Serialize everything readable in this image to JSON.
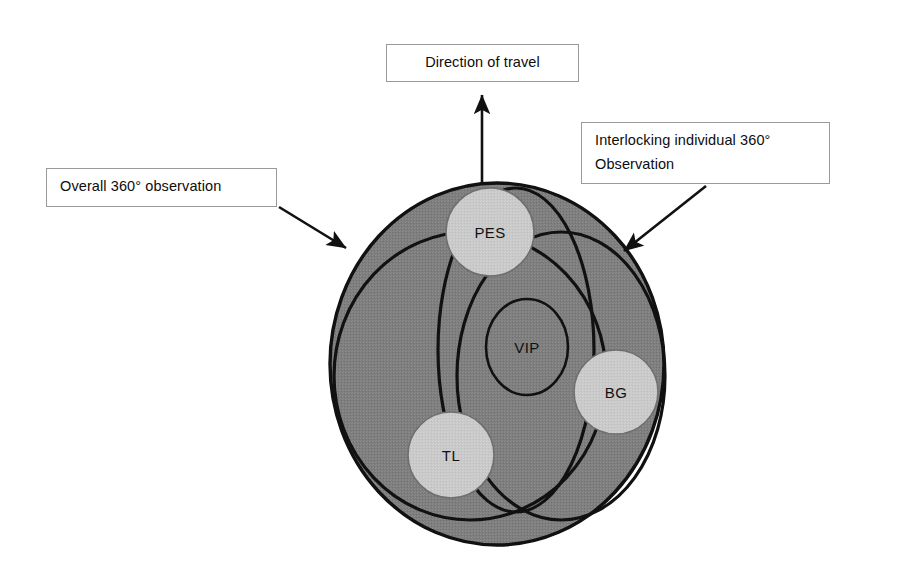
{
  "figure": {
    "type": "diagram",
    "background_color": "#ffffff",
    "body_fill_color": "#7e7e7e",
    "person_fill_color": "#c9c9c9",
    "outline_color": "#111111"
  },
  "callouts": {
    "direction": {
      "label": "Direction of travel",
      "arrow": "arrow-up"
    },
    "overall": {
      "label": "Overall 360° observation",
      "arrow": "arrow-down-right"
    },
    "interlocking": {
      "line1": "Interlocking individual 360°",
      "line2": "Observation",
      "arrow": "arrow-down-left"
    }
  },
  "nodes": [
    {
      "id": "pes",
      "label": "PES",
      "cx": 490,
      "cy": 232,
      "r": 44,
      "filled": true
    },
    {
      "id": "vip",
      "label": "VIP",
      "cx": 527,
      "cy": 347,
      "rx": 41,
      "ry": 48,
      "filled": false
    },
    {
      "id": "bg",
      "label": "BG",
      "cx": 616,
      "cy": 392,
      "r": 42,
      "filled": true
    },
    {
      "id": "tl",
      "label": "TL",
      "cx": 451,
      "cy": 455,
      "r": 43,
      "filled": true
    }
  ],
  "observation_arcs": [
    {
      "id": "overall-observation",
      "shape": "ellipse",
      "cx": 497,
      "cy": 364,
      "rx": 167,
      "ry": 181
    },
    {
      "id": "arc-left",
      "shape": "ellipse",
      "cx": 470,
      "cy": 376,
      "rx": 136,
      "ry": 144
    },
    {
      "id": "arc-right",
      "shape": "ellipse",
      "cx": 561,
      "cy": 376,
      "rx": 104,
      "ry": 144
    },
    {
      "id": "arc-center-vertical",
      "shape": "ellipse",
      "cx": 516,
      "cy": 350,
      "rx": 78,
      "ry": 162
    }
  ]
}
